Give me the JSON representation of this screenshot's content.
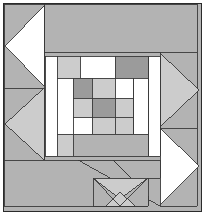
{
  "image": {
    "title": "Quilt Block Pattern",
    "width": 205,
    "height": 215,
    "background_color": "#ffffff"
  },
  "palette": {
    "white": "#ffffff",
    "light_gray": "#cccccc",
    "medium_gray": "#b3b3b3",
    "dark_gray": "#9b9b9b",
    "outline": "#3a3a3a",
    "frame": "#2b2b2b"
  },
  "frame": {
    "x": 3.5,
    "y": 3.5,
    "width": 198,
    "height": 208,
    "stroke_color": "#2b2b2b",
    "stroke_width": 1.6
  },
  "chart_data": {
    "type": "table",
    "xlabel": "",
    "ylabel": "",
    "grid": false,
    "legend_position": "none",
    "categories": [
      "background",
      "top-band",
      "left-triangles",
      "right-triangles",
      "center-block",
      "bottom-diagonal",
      "bottom-bowtie"
    ],
    "values": [
      1,
      1,
      2,
      2,
      17,
      3,
      4
    ]
  },
  "regions": [
    {
      "name": "background-fill",
      "shape": "rect",
      "points": "4,4 201,4 201,211 4,211",
      "fill": "#b3b3b3",
      "outline": false
    },
    {
      "name": "top-band-right",
      "shape": "polygon",
      "points": "44,4 197,4 197,52 44,52",
      "fill": "#b3b3b3",
      "outline": true
    },
    {
      "name": "left-column-upper-gray",
      "shape": "polygon",
      "points": "4,4 44,4 44,88 4,88",
      "fill": "#b3b3b3",
      "outline": true
    },
    {
      "name": "left-white-triangle",
      "shape": "polygon",
      "points": "44,6 44,86 5,46",
      "fill": "#ffffff",
      "outline": true
    },
    {
      "name": "left-column-lower-gray",
      "shape": "polygon",
      "points": "4,88 44,88 44,160 4,160",
      "fill": "#b3b3b3",
      "outline": true
    },
    {
      "name": "left-light-triangle",
      "shape": "polygon",
      "points": "44,88 44,160 5,124",
      "fill": "#cccccc",
      "outline": true
    },
    {
      "name": "right-column-upper-gray",
      "shape": "polygon",
      "points": "160,52 197,52 197,128 160,128",
      "fill": "#b3b3b3",
      "outline": true
    },
    {
      "name": "right-light-triangle",
      "shape": "polygon",
      "points": "160,53 160,127 199,90",
      "fill": "#cccccc",
      "outline": true
    },
    {
      "name": "right-column-lower-gray",
      "shape": "polygon",
      "points": "160,128 197,128 197,206 160,206",
      "fill": "#b3b3b3",
      "outline": true
    },
    {
      "name": "right-white-triangle",
      "shape": "polygon",
      "points": "160,128 160,205 199,166",
      "fill": "#ffffff",
      "outline": true
    },
    {
      "name": "center-left-white-sash",
      "shape": "rect",
      "points": "45,56 57,56 57,156 45,156",
      "fill": "#ffffff",
      "outline": true
    },
    {
      "name": "center-right-white-sash",
      "shape": "rect",
      "points": "148,56 160,56 160,156 148,156",
      "fill": "#ffffff",
      "outline": true
    },
    {
      "name": "center-top-left-light",
      "shape": "rect",
      "points": "57,56 80,56 80,78 57,78",
      "fill": "#cccccc",
      "outline": true
    },
    {
      "name": "center-top-mid-white",
      "shape": "rect",
      "points": "80,56 115,56 115,78 80,78",
      "fill": "#ffffff",
      "outline": true
    },
    {
      "name": "center-top-right-dark",
      "shape": "rect",
      "points": "115,56 148,56 148,78 115,78",
      "fill": "#9b9b9b",
      "outline": true
    },
    {
      "name": "center-left-white-inner",
      "shape": "rect",
      "points": "57,78 73,78 73,134 57,134",
      "fill": "#ffffff",
      "outline": true
    },
    {
      "name": "center-right-white-inner",
      "shape": "rect",
      "points": "133,78 148,78 148,134 133,134",
      "fill": "#ffffff",
      "outline": true
    },
    {
      "name": "center-grid-r1c1-dark",
      "shape": "rect",
      "points": "73,78 92,78 92,98 73,98",
      "fill": "#9b9b9b",
      "outline": true
    },
    {
      "name": "center-grid-r1c2-light",
      "shape": "rect",
      "points": "92,78 115,78 115,98 92,98",
      "fill": "#cccccc",
      "outline": true
    },
    {
      "name": "center-grid-r1c3-white",
      "shape": "rect",
      "points": "115,78 133,78 133,98 115,98",
      "fill": "#ffffff",
      "outline": true
    },
    {
      "name": "center-grid-r2c1-light",
      "shape": "rect",
      "points": "73,98 92,98 92,117 73,117",
      "fill": "#cccccc",
      "outline": true
    },
    {
      "name": "center-grid-r2c2-dark",
      "shape": "rect",
      "points": "92,98 115,98 115,117 92,117",
      "fill": "#9b9b9b",
      "outline": true
    },
    {
      "name": "center-grid-r2c3-light",
      "shape": "rect",
      "points": "115,98 133,98 133,117 115,117",
      "fill": "#cccccc",
      "outline": true
    },
    {
      "name": "center-grid-r3c1-white",
      "shape": "rect",
      "points": "73,117 92,117 92,134 73,134",
      "fill": "#ffffff",
      "outline": true
    },
    {
      "name": "center-grid-r3c2-light",
      "shape": "rect",
      "points": "92,117 115,117 115,134 92,134",
      "fill": "#cccccc",
      "outline": true
    },
    {
      "name": "center-grid-r3c3-light",
      "shape": "rect",
      "points": "115,117 133,117 133,134 115,134",
      "fill": "#cccccc",
      "outline": true
    },
    {
      "name": "center-bottom-left-light",
      "shape": "rect",
      "points": "57,134 73,134 73,156 57,156",
      "fill": "#cccccc",
      "outline": true
    },
    {
      "name": "center-bottom-band-dark",
      "shape": "rect",
      "points": "73,134 148,134 148,156 73,156",
      "fill": "#b3b3b3",
      "outline": true
    },
    {
      "name": "bottom-left-gray-block",
      "shape": "polygon",
      "points": "4,160 113,160 148,196 148,206 4,206",
      "fill": "#b3b3b3",
      "outline": true
    },
    {
      "name": "bottom-long-diagonal",
      "shape": "polyline",
      "points": "78,160 160,206",
      "fill": "none",
      "outline": true
    },
    {
      "name": "bottom-band-right",
      "shape": "polygon",
      "points": "113,160 160,160 160,178 131,178",
      "fill": "#b3b3b3",
      "outline": true
    },
    {
      "name": "bowtie-panel",
      "shape": "rect",
      "points": "93,178 148,178 148,206 93,206",
      "fill": "#b3b3b3",
      "outline": true
    },
    {
      "name": "bowtie-top-light-triangle",
      "shape": "polygon",
      "points": "93,178 148,178 120,199",
      "fill": "#cccccc",
      "outline": true
    },
    {
      "name": "bowtie-bottom-light-triangle",
      "shape": "polygon",
      "points": "106,206 135,206 120,192",
      "fill": "#cccccc",
      "outline": true
    },
    {
      "name": "bowtie-cross-left",
      "shape": "polyline",
      "points": "93,178 120,206",
      "fill": "none",
      "outline": true
    },
    {
      "name": "bowtie-cross-right",
      "shape": "polyline",
      "points": "148,178 120,206",
      "fill": "none",
      "outline": true
    }
  ]
}
